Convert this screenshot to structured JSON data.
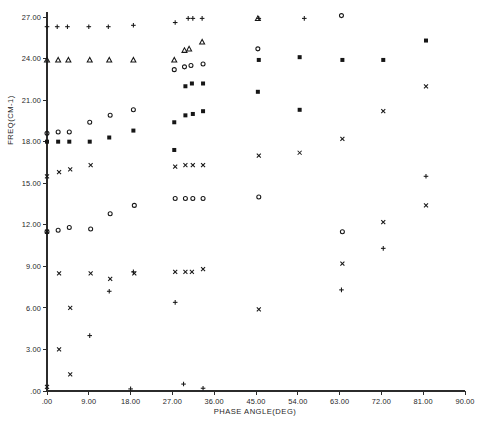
{
  "chart_data": {
    "type": "scatter",
    "title": "",
    "xlabel": "PHASE ANGLE(DEG)",
    "ylabel": "FREQ(CM-1)",
    "xlim": [
      0,
      90
    ],
    "ylim": [
      0,
      27
    ],
    "grid": false,
    "legend": "none",
    "xticks": [
      ".00",
      "9.00",
      "18.00",
      "27.00",
      "36.00",
      "45.00",
      "54.00",
      "63.00",
      "72.00",
      "81.00",
      "90.00"
    ],
    "xtick_values": [
      0,
      9,
      18,
      27,
      36,
      45,
      54,
      63,
      72,
      81,
      90
    ],
    "yticks": [
      ".00",
      "3.00",
      "6.00",
      "9.00",
      "12.00",
      "15.00",
      "18.00",
      "21.00",
      "24.00",
      "27.00"
    ],
    "ytick_values": [
      0,
      3,
      6,
      9,
      12,
      15,
      18,
      21,
      24,
      27
    ],
    "marker_color": "#161616",
    "series": [
      {
        "name": "branch-1",
        "marker": "plus",
        "points": [
          [
            0.0,
            26.3
          ],
          [
            2.2,
            26.3
          ],
          [
            4.4,
            26.3
          ],
          [
            9.0,
            26.3
          ],
          [
            13.2,
            26.3
          ],
          [
            18.6,
            26.4
          ],
          [
            27.6,
            26.6
          ],
          [
            30.4,
            26.9
          ],
          [
            31.4,
            26.9
          ],
          [
            33.4,
            26.9
          ],
          [
            45.6,
            26.9
          ],
          [
            55.4,
            26.9
          ],
          [
            18.0,
            0.15
          ],
          [
            29.4,
            0.5
          ],
          [
            33.6,
            0.2
          ],
          [
            9.2,
            4.0
          ],
          [
            13.4,
            7.2
          ],
          [
            18.6,
            8.6
          ],
          [
            27.6,
            6.4
          ],
          [
            63.4,
            7.3
          ],
          [
            72.4,
            10.3
          ],
          [
            81.6,
            15.5
          ]
        ]
      },
      {
        "name": "branch-2",
        "marker": "triangle",
        "points": [
          [
            0.0,
            23.9
          ],
          [
            2.4,
            23.9
          ],
          [
            4.6,
            23.9
          ],
          [
            9.2,
            23.9
          ],
          [
            13.4,
            23.9
          ],
          [
            18.6,
            23.9
          ],
          [
            27.4,
            23.9
          ],
          [
            29.6,
            24.6
          ],
          [
            30.6,
            24.7
          ],
          [
            33.4,
            25.2
          ],
          [
            45.4,
            26.9
          ]
        ]
      },
      {
        "name": "branch-3",
        "marker": "circle",
        "points": [
          [
            0.0,
            18.6
          ],
          [
            2.4,
            18.7
          ],
          [
            4.8,
            18.7
          ],
          [
            9.2,
            19.4
          ],
          [
            13.6,
            19.9
          ],
          [
            18.6,
            20.3
          ],
          [
            27.4,
            23.2
          ],
          [
            29.6,
            23.4
          ],
          [
            31.0,
            23.5
          ],
          [
            33.6,
            23.6
          ],
          [
            45.4,
            24.7
          ],
          [
            63.4,
            27.1
          ],
          [
            0.0,
            11.5
          ],
          [
            2.4,
            11.6
          ],
          [
            4.8,
            11.8
          ],
          [
            9.4,
            11.7
          ],
          [
            13.6,
            12.8
          ],
          [
            18.8,
            13.4
          ],
          [
            27.6,
            13.9
          ],
          [
            29.8,
            13.9
          ],
          [
            31.4,
            13.9
          ],
          [
            33.6,
            13.9
          ],
          [
            45.6,
            14.0
          ],
          [
            63.6,
            11.5
          ]
        ]
      },
      {
        "name": "branch-4",
        "marker": "square",
        "points": [
          [
            0.0,
            18.0
          ],
          [
            2.4,
            18.0
          ],
          [
            4.8,
            18.0
          ],
          [
            9.2,
            18.0
          ],
          [
            13.4,
            18.3
          ],
          [
            18.6,
            18.8
          ],
          [
            27.4,
            19.4
          ],
          [
            29.8,
            22.0
          ],
          [
            31.2,
            22.2
          ],
          [
            33.6,
            22.2
          ],
          [
            45.4,
            21.6
          ],
          [
            54.4,
            24.1
          ],
          [
            63.6,
            23.9
          ],
          [
            72.4,
            23.9
          ],
          [
            81.6,
            25.3
          ],
          [
            45.6,
            23.9
          ],
          [
            54.4,
            20.3
          ],
          [
            29.8,
            19.9
          ],
          [
            31.4,
            20.0
          ],
          [
            33.6,
            20.2
          ],
          [
            27.4,
            17.4
          ]
        ]
      },
      {
        "name": "branch-5",
        "marker": "ex",
        "points": [
          [
            0.0,
            15.5
          ],
          [
            2.6,
            15.8
          ],
          [
            5.0,
            16.0
          ],
          [
            9.4,
            16.3
          ],
          [
            27.6,
            16.2
          ],
          [
            29.8,
            16.3
          ],
          [
            31.4,
            16.3
          ],
          [
            33.6,
            16.3
          ],
          [
            45.6,
            17.0
          ],
          [
            54.4,
            17.2
          ],
          [
            63.6,
            18.2
          ],
          [
            72.4,
            20.2
          ],
          [
            81.6,
            22.0
          ],
          [
            0.0,
            11.5
          ],
          [
            2.6,
            8.5
          ],
          [
            5.0,
            6.0
          ],
          [
            9.4,
            8.5
          ],
          [
            13.6,
            8.1
          ],
          [
            18.8,
            8.5
          ],
          [
            27.6,
            8.6
          ],
          [
            29.8,
            8.6
          ],
          [
            31.2,
            8.6
          ],
          [
            33.6,
            8.8
          ],
          [
            45.6,
            5.9
          ],
          [
            63.6,
            9.2
          ],
          [
            72.4,
            12.2
          ],
          [
            81.6,
            13.4
          ],
          [
            0.0,
            0.3
          ],
          [
            2.6,
            3.0
          ],
          [
            5.0,
            1.2
          ]
        ]
      }
    ]
  },
  "plot": {
    "y_axis_name": "frequency-axis",
    "x_axis_name": "phase-angle-axis"
  }
}
